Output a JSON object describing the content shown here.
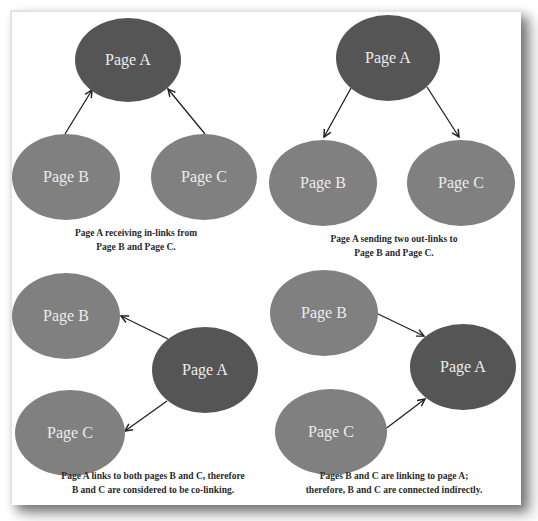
{
  "colors": {
    "target_node": "#555555",
    "other_node": "#808080",
    "node_text": "#ececec",
    "edge": "#222222",
    "caption_text": "#2a2a2a"
  },
  "panels": [
    {
      "id": "in-links",
      "nodes": [
        {
          "label": "Page A",
          "cx": 128,
          "cy": 60,
          "rx": 53,
          "ry": 42,
          "role": "target"
        },
        {
          "label": "Page B",
          "cx": 66,
          "cy": 177,
          "rx": 54,
          "ry": 43,
          "role": "other"
        },
        {
          "label": "Page C",
          "cx": 204,
          "cy": 177,
          "rx": 53,
          "ry": 43,
          "role": "other"
        }
      ],
      "edges": [
        {
          "from": "Page B",
          "to": "Page A",
          "x1": 65,
          "y1": 134,
          "x2": 92,
          "y2": 90
        },
        {
          "from": "Page C",
          "to": "Page A",
          "x1": 205,
          "y1": 134,
          "x2": 168,
          "y2": 89
        }
      ],
      "caption": {
        "line1": "Page A receiving in-links from",
        "line2": "Page B and Page C.",
        "x": 136,
        "y1": 236,
        "y2": 250
      }
    },
    {
      "id": "out-links",
      "nodes": [
        {
          "label": "Page A",
          "cx": 388,
          "cy": 58,
          "rx": 52,
          "ry": 43,
          "role": "target"
        },
        {
          "label": "Page B",
          "cx": 323,
          "cy": 183,
          "rx": 54,
          "ry": 43,
          "role": "other"
        },
        {
          "label": "Page C",
          "cx": 461,
          "cy": 183,
          "rx": 54,
          "ry": 43,
          "role": "other"
        }
      ],
      "edges": [
        {
          "from": "Page A",
          "to": "Page B",
          "x1": 351,
          "y1": 88,
          "x2": 324,
          "y2": 137
        },
        {
          "from": "Page A",
          "to": "Page C",
          "x1": 427,
          "y1": 87,
          "x2": 459,
          "y2": 137
        }
      ],
      "caption": {
        "line1": "Page A sending two out-links to",
        "line2": "Page B and Page C.",
        "x": 394,
        "y1": 242,
        "y2": 256
      }
    },
    {
      "id": "co-linking",
      "nodes": [
        {
          "label": "Page B",
          "cx": 66,
          "cy": 316,
          "rx": 54,
          "ry": 43,
          "role": "other"
        },
        {
          "label": "Page A",
          "cx": 205,
          "cy": 370,
          "rx": 53,
          "ry": 43,
          "role": "target"
        },
        {
          "label": "Page C",
          "cx": 70,
          "cy": 433,
          "rx": 55,
          "ry": 43,
          "role": "other"
        }
      ],
      "edges": [
        {
          "from": "Page A",
          "to": "Page B",
          "x1": 168,
          "y1": 339,
          "x2": 121,
          "y2": 316
        },
        {
          "from": "Page A",
          "to": "Page C",
          "x1": 167,
          "y1": 401,
          "x2": 125,
          "y2": 431
        }
      ],
      "caption": {
        "line1": "Page A links to both pages B and C, therefore",
        "line2": "B and C are considered to be co-linking.",
        "x": 153,
        "y1": 479,
        "y2": 493
      }
    },
    {
      "id": "indirect",
      "nodes": [
        {
          "label": "Page B",
          "cx": 324,
          "cy": 313,
          "rx": 54,
          "ry": 43,
          "role": "other"
        },
        {
          "label": "Page A",
          "cx": 463,
          "cy": 367,
          "rx": 53,
          "ry": 43,
          "role": "target"
        },
        {
          "label": "Page C",
          "cx": 331,
          "cy": 432,
          "rx": 56,
          "ry": 43,
          "role": "other"
        }
      ],
      "edges": [
        {
          "from": "Page B",
          "to": "Page A",
          "x1": 376,
          "y1": 313,
          "x2": 424,
          "y2": 336
        },
        {
          "from": "Page C",
          "to": "Page A",
          "x1": 384,
          "y1": 430,
          "x2": 425,
          "y2": 399
        }
      ],
      "caption": {
        "line1": "Pages B and C are linking to page A;",
        "line2": "therefore, B and C are connected indirectly.",
        "x": 394,
        "y1": 479,
        "y2": 493
      }
    }
  ]
}
